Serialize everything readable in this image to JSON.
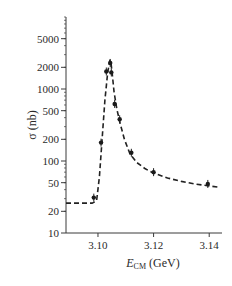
{
  "chart_data": {
    "type": "scatter",
    "title": "",
    "xlabel": "E_CM (GeV)",
    "xlabel_main": "E",
    "xlabel_sub": "CM",
    "xlabel_unit": " (GeV)",
    "ylabel": "σ (nb)",
    "xlim": [
      3.0885,
      3.1446
    ],
    "ylim": [
      10,
      10000
    ],
    "yscale": "log",
    "grid": false,
    "legend": null,
    "x_ticks": [
      3.1,
      3.12,
      3.14
    ],
    "x_tick_labels": [
      "3.10",
      "3.12",
      "3.14"
    ],
    "y_ticks": [
      10,
      20,
      50,
      100,
      200,
      500,
      1000,
      2000,
      5000
    ],
    "y_tick_labels": [
      "10",
      "20",
      "50",
      "100",
      "200",
      "500",
      "1000",
      "2000",
      "5000"
    ],
    "series": [
      {
        "name": "measurements",
        "style": "points-with-error-bars",
        "x": [
          3.0985,
          3.1011,
          3.103,
          3.1044,
          3.1048,
          3.106,
          3.1078,
          3.112,
          3.12,
          3.1395
        ],
        "y": [
          31,
          180,
          1750,
          2300,
          1700,
          620,
          380,
          130,
          70,
          48
        ]
      },
      {
        "name": "fit",
        "style": "dashed-line",
        "x": [
          3.0885,
          3.098,
          3.0995,
          3.1005,
          3.1015,
          3.1025,
          3.1035,
          3.1043,
          3.1046,
          3.105,
          3.1058,
          3.1068,
          3.108,
          3.1095,
          3.1115,
          3.114,
          3.117,
          3.12,
          3.125,
          3.13,
          3.135,
          3.14,
          3.144
        ],
        "y": [
          26,
          26,
          28,
          60,
          200,
          700,
          1700,
          2500,
          2400,
          1800,
          900,
          520,
          330,
          200,
          125,
          95,
          78,
          68,
          58,
          52,
          48,
          45,
          43
        ]
      }
    ]
  }
}
